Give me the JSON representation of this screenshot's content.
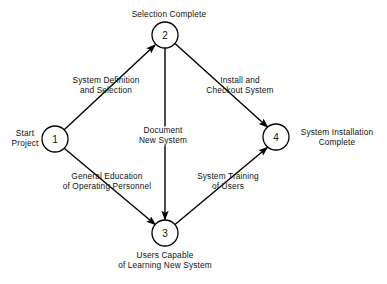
{
  "diagram": {
    "type": "activity-on-arrow-network",
    "colors": {
      "background": "#ffffff",
      "stroke": "#000000",
      "text": "#111111"
    },
    "nodes": [
      {
        "id": "1",
        "label": "1",
        "cx": 55,
        "cy": 139,
        "r": 13,
        "side_label": "Start\nProject",
        "side_label_lines": [
          "Start",
          "Project"
        ]
      },
      {
        "id": "2",
        "label": "2",
        "cx": 165,
        "cy": 35,
        "r": 13,
        "side_label": "Selection Complete",
        "side_label_lines": [
          "Selection Complete"
        ]
      },
      {
        "id": "3",
        "label": "3",
        "cx": 165,
        "cy": 233,
        "r": 13,
        "side_label": "Users Capable of Learning New System",
        "side_label_lines": [
          "Users Capable",
          "of Learning New System"
        ]
      },
      {
        "id": "4",
        "label": "4",
        "cx": 276,
        "cy": 137,
        "r": 13,
        "side_label": "System Installation Complete",
        "side_label_lines": [
          "System Installation",
          "Complete"
        ]
      }
    ],
    "node_labels": [
      {
        "name": "node-1-label",
        "lines": [
          "Start",
          "Project"
        ],
        "x": 25,
        "y": 139
      },
      {
        "name": "node-2-label",
        "lines": [
          "Selection Complete"
        ],
        "x": 169,
        "y": 15
      },
      {
        "name": "node-3-label",
        "lines": [
          "Users Capable",
          "of Learning New System"
        ],
        "x": 165,
        "y": 261
      },
      {
        "name": "node-4-label",
        "lines": [
          "System Installation",
          "Complete"
        ],
        "x": 337,
        "y": 138
      }
    ],
    "edges": [
      {
        "id": "e1",
        "from": "1",
        "to": "2",
        "label_lines": [
          "System Definition",
          "and Selection"
        ],
        "label_x": 106,
        "label_y": 86,
        "arrow": true
      },
      {
        "id": "e2",
        "from": "1",
        "to": "3",
        "label_lines": [
          "General Education",
          "of Operating Personnel"
        ],
        "label_x": 107,
        "label_y": 182,
        "arrow": true
      },
      {
        "id": "e3",
        "from": "2",
        "to": "3",
        "label_lines": [
          "Document",
          "New System"
        ],
        "label_x": 163,
        "label_y": 136,
        "arrow": true
      },
      {
        "id": "e4",
        "from": "2",
        "to": "4",
        "label_lines": [
          "Install and",
          "Checkout System"
        ],
        "label_x": 240,
        "label_y": 86,
        "arrow": true
      },
      {
        "id": "e5",
        "from": "3",
        "to": "4",
        "label_lines": [
          "System Training",
          "of Users"
        ],
        "label_x": 228,
        "label_y": 182,
        "arrow": true
      }
    ]
  }
}
